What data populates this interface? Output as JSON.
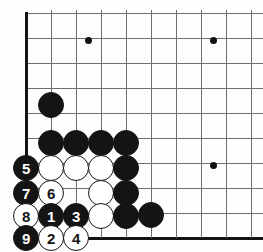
{
  "diagram": {
    "kind": "go-board-diagram",
    "board_region": "bottom-left corner",
    "grid": {
      "origin_x": 26,
      "origin_y": 13,
      "spacing": 25,
      "columns": 10,
      "rows": 10,
      "left_edge_x": 26,
      "bottom_edge_y": 238,
      "line_color": "#6e6e6e",
      "edge_color": "#141414",
      "background": "#fdfdfd"
    },
    "stone_radius": 13,
    "colors": {
      "black_stone": "#141414",
      "white_stone": "#ffffff",
      "black_label": "#ffffff",
      "white_label": "#141414"
    },
    "star_points": [
      {
        "name": "star-point-upper",
        "x": 88,
        "y": 40
      },
      {
        "name": "star-point-upper-right",
        "x": 213,
        "y": 40
      },
      {
        "name": "star-point-lower-right",
        "x": 213,
        "y": 165
      }
    ],
    "stones": [
      {
        "id": "black-outpost-upper",
        "color": "black",
        "label": "",
        "x": 51,
        "y": 105
      },
      {
        "id": "black-wall-a",
        "color": "black",
        "label": "",
        "x": 51,
        "y": 143
      },
      {
        "id": "black-wall-b",
        "color": "black",
        "label": "",
        "x": 76,
        "y": 143
      },
      {
        "id": "black-wall-c",
        "color": "black",
        "label": "",
        "x": 101,
        "y": 143
      },
      {
        "id": "black-wall-d",
        "color": "black",
        "label": "",
        "x": 126,
        "y": 143
      },
      {
        "id": "move-5",
        "color": "black",
        "label": "5",
        "x": 26,
        "y": 168
      },
      {
        "id": "white-group-a",
        "color": "white",
        "label": "",
        "x": 51,
        "y": 168
      },
      {
        "id": "white-group-b",
        "color": "white",
        "label": "",
        "x": 76,
        "y": 168
      },
      {
        "id": "white-group-c",
        "color": "white",
        "label": "",
        "x": 101,
        "y": 168
      },
      {
        "id": "black-side-a",
        "color": "black",
        "label": "",
        "x": 126,
        "y": 168
      },
      {
        "id": "move-7",
        "color": "black",
        "label": "7",
        "x": 26,
        "y": 193
      },
      {
        "id": "move-6",
        "color": "white",
        "label": "6",
        "x": 51,
        "y": 193
      },
      {
        "id": "white-group-d",
        "color": "white",
        "label": "",
        "x": 101,
        "y": 193
      },
      {
        "id": "black-side-b",
        "color": "black",
        "label": "",
        "x": 126,
        "y": 193
      },
      {
        "id": "move-8",
        "color": "white",
        "label": "8",
        "x": 26,
        "y": 216
      },
      {
        "id": "move-1",
        "color": "black",
        "label": "1",
        "x": 51,
        "y": 216
      },
      {
        "id": "move-3",
        "color": "black",
        "label": "3",
        "x": 76,
        "y": 216
      },
      {
        "id": "white-group-e",
        "color": "white",
        "label": "",
        "x": 101,
        "y": 216
      },
      {
        "id": "black-side-c",
        "color": "black",
        "label": "",
        "x": 126,
        "y": 216
      },
      {
        "id": "black-outpost-lower",
        "color": "black",
        "label": "",
        "x": 151,
        "y": 215
      },
      {
        "id": "move-9",
        "color": "black",
        "label": "9",
        "x": 26,
        "y": 238
      },
      {
        "id": "move-2",
        "color": "white",
        "label": "2",
        "x": 51,
        "y": 238
      },
      {
        "id": "move-4",
        "color": "white",
        "label": "4",
        "x": 76,
        "y": 238
      }
    ],
    "move_sequence": [
      "1",
      "2",
      "3",
      "4",
      "5",
      "6",
      "7",
      "8",
      "9"
    ]
  }
}
